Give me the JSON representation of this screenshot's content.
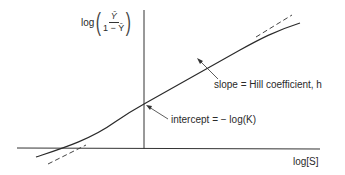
{
  "diagram": {
    "y_axis_label": {
      "prefix": "log",
      "numerator": "Ȳ",
      "denominator": "1 − Ȳ"
    },
    "x_axis_label": "log[S]",
    "annotations": {
      "slope": "slope = Hill coefficient, h",
      "intercept": "intercept = − log(K)"
    },
    "colors": {
      "line": "#2a2a2a",
      "background": "#ffffff"
    }
  }
}
